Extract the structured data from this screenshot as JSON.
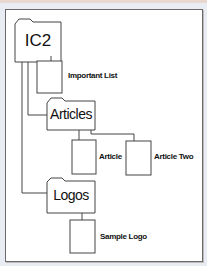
{
  "diagram": {
    "type": "folder-tree",
    "root": {
      "label": "IC2",
      "kind": "folder",
      "children": [
        {
          "label": "Important List",
          "kind": "document"
        },
        {
          "label": "Articles",
          "kind": "folder",
          "children": [
            {
              "label": "Article",
              "kind": "document"
            },
            {
              "label": "Article Two",
              "kind": "document"
            }
          ]
        },
        {
          "label": "Logos",
          "kind": "folder",
          "children": [
            {
              "label": "Sample Logo",
              "kind": "document"
            }
          ]
        }
      ]
    },
    "labels": {
      "ic2": "IC2",
      "important_list": "Important List",
      "articles": "Articles",
      "article": "Article",
      "article_two": "Article Two",
      "logos": "Logos",
      "sample_logo": "Sample Logo"
    },
    "colors": {
      "background": "#e9ecf2",
      "frame_border": "#6a6a6a",
      "line": "#444444",
      "text": "#111111"
    }
  }
}
